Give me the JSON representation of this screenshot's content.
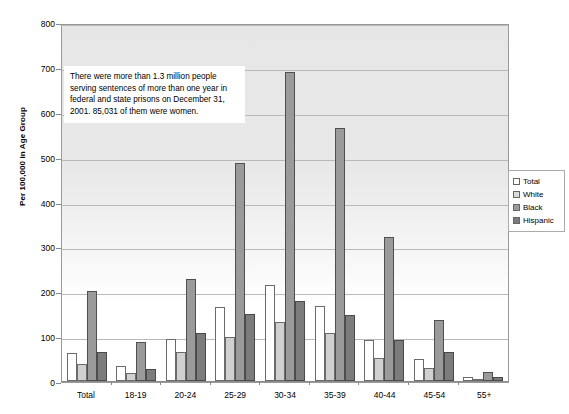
{
  "chart_data": {
    "type": "bar",
    "title": "",
    "xlabel": "",
    "ylabel": "Per 100,000 in Age Group",
    "ylim": [
      0,
      800
    ],
    "yticks": [
      0,
      100,
      200,
      300,
      400,
      500,
      600,
      700,
      800
    ],
    "grid": true,
    "legend_position": "right",
    "categories": [
      "Total",
      "18-19",
      "20-24",
      "25-29",
      "30-34",
      "35-39",
      "40-44",
      "45-54",
      "55+"
    ],
    "series": [
      {
        "name": "Total",
        "values": [
          62,
          33,
          94,
          166,
          213,
          167,
          92,
          50,
          8
        ]
      },
      {
        "name": "White",
        "values": [
          37,
          17,
          65,
          97,
          131,
          106,
          52,
          30,
          5
        ]
      },
      {
        "name": "Black",
        "values": [
          201,
          86,
          227,
          486,
          688,
          564,
          322,
          137,
          21
        ]
      },
      {
        "name": "Hispanic",
        "values": [
          65,
          26,
          108,
          150,
          178,
          148,
          91,
          65,
          10
        ]
      }
    ],
    "annotation": "There were more than 1.3 million people serving sentences of more than one year in federal and state prisons on December 31, 2001.  85,031 of them were women."
  },
  "legend": {
    "items": [
      {
        "label": "Total"
      },
      {
        "label": "White"
      },
      {
        "label": "Black"
      },
      {
        "label": "Hispanic"
      }
    ]
  },
  "colors": {
    "total": "#ffffff",
    "white": "#d0d0d0",
    "black": "#9a9a9a",
    "hispanic": "#7c7c7c",
    "plot_background": "#ececec",
    "gridline": "#b9b9b9"
  }
}
